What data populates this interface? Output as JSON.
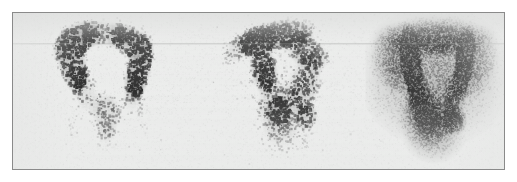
{
  "figure": {
    "kind": "nuclear-medicine-scintigraphy",
    "modality": "bone-scintigraphy",
    "panel_count": 3,
    "caption": "",
    "title": "",
    "labels_present": false,
    "annotations": [],
    "text_elements": []
  },
  "frame": {
    "border_color": "#8a8a8a",
    "border_width_px": 1,
    "plate_background": "#ebeceb",
    "page_background": "#ffffff",
    "x": 12,
    "y": 12,
    "width": 493,
    "height": 158
  },
  "palette": {
    "max_uptake": "#121212",
    "high_uptake": "#2b2b2b",
    "mid_uptake": "#6e6e6e",
    "low_uptake": "#b8b9b8",
    "background_soft_tissue": "#e6e7e6",
    "plate": "#ebeceb",
    "border": "#8a8a8a"
  },
  "artifacts": [
    {
      "name": "horizontal-scan-line",
      "y": 30,
      "opacity": 0.3
    },
    {
      "name": "horizontal-scan-line-faint",
      "y": 31,
      "opacity": 0.14
    }
  ],
  "chart_data": {
    "type": "heatmap",
    "title": "",
    "xlabel": "",
    "ylabel": "",
    "intensity_scale": {
      "min": 0,
      "max": 1,
      "min_label": "low counts",
      "max_label": "high counts",
      "colormap": "inverted-grayscale"
    },
    "panels": [
      {
        "index": 0,
        "name": "panel-left",
        "view": "anterior",
        "x": 18,
        "y": 0,
        "width": 150,
        "height": 156,
        "grain": "coarse",
        "dot_count": 5200,
        "dot_size_px": [
          1,
          3
        ],
        "count_density": "low",
        "noise_seed": 1207,
        "blobs": [
          {
            "name": "left-iliac-crest-arc",
            "cx": 0.3,
            "cy": 0.17,
            "rx": 0.16,
            "ry": 0.085,
            "rot": -32,
            "intensity": 0.98,
            "softness": 0.3
          },
          {
            "name": "left-iliac-wing-band",
            "cx": 0.265,
            "cy": 0.3,
            "rx": 0.085,
            "ry": 0.185,
            "rot": -12,
            "intensity": 0.97,
            "softness": 0.32
          },
          {
            "name": "sacroiliac-arch-superior",
            "cx": 0.47,
            "cy": 0.125,
            "rx": 0.22,
            "ry": 0.075,
            "rot": 0,
            "intensity": 0.62,
            "softness": 0.52
          },
          {
            "name": "right-iliac-crest-arc",
            "cx": 0.655,
            "cy": 0.185,
            "rx": 0.145,
            "ry": 0.08,
            "rot": 30,
            "intensity": 0.86,
            "softness": 0.36
          },
          {
            "name": "right-iliac-wing-band",
            "cx": 0.715,
            "cy": 0.335,
            "rx": 0.075,
            "ry": 0.19,
            "rot": 12,
            "intensity": 0.95,
            "softness": 0.32
          },
          {
            "name": "left-acetabular-region",
            "cx": 0.355,
            "cy": 0.5,
            "rx": 0.075,
            "ry": 0.135,
            "rot": -8,
            "intensity": 0.46,
            "softness": 0.58
          },
          {
            "name": "right-acetabular-region",
            "cx": 0.675,
            "cy": 0.505,
            "rx": 0.07,
            "ry": 0.13,
            "rot": 8,
            "intensity": 0.44,
            "softness": 0.58
          },
          {
            "name": "bladder-midline-activity",
            "cx": 0.5,
            "cy": 0.645,
            "rx": 0.085,
            "ry": 0.13,
            "rot": 0,
            "intensity": 0.58,
            "softness": 0.5
          },
          {
            "name": "pubic-symphysis-faint",
            "cx": 0.495,
            "cy": 0.8,
            "rx": 0.065,
            "ry": 0.065,
            "rot": 0,
            "intensity": 0.26,
            "softness": 0.66
          },
          {
            "name": "left-femur-shaft-trace",
            "cx": 0.275,
            "cy": 0.76,
            "rx": 0.035,
            "ry": 0.155,
            "rot": -5,
            "intensity": 0.16,
            "softness": 0.7
          },
          {
            "name": "right-femur-shaft-trace",
            "cx": 0.735,
            "cy": 0.71,
            "rx": 0.035,
            "ry": 0.13,
            "rot": 5,
            "intensity": 0.14,
            "softness": 0.72
          }
        ]
      },
      {
        "index": 1,
        "name": "panel-middle",
        "view": "oblique",
        "x": 196,
        "y": 0,
        "width": 150,
        "height": 156,
        "grain": "coarse",
        "dot_count": 6400,
        "dot_size_px": [
          1,
          3
        ],
        "count_density": "medium",
        "noise_seed": 4471,
        "focal_lesion": {
          "name": "focal-hot-spot",
          "cx": 0.455,
          "cy": 0.625,
          "intensity": 1.0,
          "note": "intense focal uptake"
        },
        "blobs": [
          {
            "name": "iliac-crest-superior-arc",
            "cx": 0.44,
            "cy": 0.135,
            "rx": 0.235,
            "ry": 0.085,
            "rot": -8,
            "intensity": 0.88,
            "softness": 0.38
          },
          {
            "name": "iliac-wing-upper-dense",
            "cx": 0.315,
            "cy": 0.175,
            "rx": 0.105,
            "ry": 0.075,
            "rot": -26,
            "intensity": 0.96,
            "softness": 0.3
          },
          {
            "name": "iliac-ala-lateral-taper",
            "cx": 0.185,
            "cy": 0.23,
            "rx": 0.105,
            "ry": 0.065,
            "rot": -30,
            "intensity": 0.5,
            "softness": 0.55
          },
          {
            "name": "posterior-ilium-band",
            "cx": 0.655,
            "cy": 0.245,
            "rx": 0.135,
            "ry": 0.085,
            "rot": 28,
            "intensity": 0.7,
            "softness": 0.46
          },
          {
            "name": "sacroiliac-joint-band",
            "cx": 0.355,
            "cy": 0.345,
            "rx": 0.075,
            "ry": 0.145,
            "rot": -10,
            "intensity": 0.84,
            "softness": 0.38
          },
          {
            "name": "greater-sciatic-margin",
            "cx": 0.635,
            "cy": 0.455,
            "rx": 0.085,
            "ry": 0.155,
            "rot": 16,
            "intensity": 0.56,
            "softness": 0.52
          },
          {
            "name": "focal-hot-spot-core",
            "cx": 0.455,
            "cy": 0.625,
            "rx": 0.075,
            "ry": 0.085,
            "rot": 0,
            "intensity": 1.0,
            "softness": 0.16
          },
          {
            "name": "focal-hot-spot-halo",
            "cx": 0.455,
            "cy": 0.625,
            "rx": 0.125,
            "ry": 0.145,
            "rot": 0,
            "intensity": 0.52,
            "softness": 0.55
          },
          {
            "name": "ischial-secondary-focus",
            "cx": 0.645,
            "cy": 0.655,
            "rx": 0.065,
            "ry": 0.075,
            "rot": 0,
            "intensity": 0.76,
            "softness": 0.4
          },
          {
            "name": "inferior-pelvic-scatter",
            "cx": 0.5,
            "cy": 0.8,
            "rx": 0.145,
            "ry": 0.095,
            "rot": 0,
            "intensity": 0.34,
            "softness": 0.64
          },
          {
            "name": "central-pelvic-fill",
            "cx": 0.48,
            "cy": 0.44,
            "rx": 0.205,
            "ry": 0.185,
            "rot": 0,
            "intensity": 0.24,
            "softness": 0.72
          }
        ]
      },
      {
        "index": 2,
        "name": "panel-right",
        "view": "anterior-high-count",
        "x": 352,
        "y": 0,
        "width": 140,
        "height": 156,
        "grain": "fine",
        "dot_count": 17000,
        "dot_size_px": [
          1,
          2
        ],
        "count_density": "high",
        "noise_seed": 8893,
        "blobs": [
          {
            "name": "pelvic-brim-outline",
            "cx": 0.5,
            "cy": 0.4,
            "rx": 0.355,
            "ry": 0.295,
            "rot": 0,
            "intensity": 0.4,
            "softness": 0.7
          },
          {
            "name": "iliac-crest-arc-superior",
            "cx": 0.5,
            "cy": 0.155,
            "rx": 0.3,
            "ry": 0.095,
            "rot": 0,
            "intensity": 0.66,
            "softness": 0.48
          },
          {
            "name": "left-sacroiliac-dense-band",
            "cx": 0.325,
            "cy": 0.305,
            "rx": 0.065,
            "ry": 0.205,
            "rot": -7,
            "intensity": 0.98,
            "softness": 0.26
          },
          {
            "name": "right-iliac-band",
            "cx": 0.705,
            "cy": 0.305,
            "rx": 0.06,
            "ry": 0.185,
            "rot": 8,
            "intensity": 0.72,
            "softness": 0.42
          },
          {
            "name": "left-iliac-ala-wash",
            "cx": 0.215,
            "cy": 0.285,
            "rx": 0.115,
            "ry": 0.155,
            "rot": -16,
            "intensity": 0.42,
            "softness": 0.66
          },
          {
            "name": "right-iliac-ala-wash",
            "cx": 0.79,
            "cy": 0.315,
            "rx": 0.1,
            "ry": 0.155,
            "rot": 16,
            "intensity": 0.38,
            "softness": 0.68
          },
          {
            "name": "bladder-dense-focus",
            "cx": 0.445,
            "cy": 0.665,
            "rx": 0.085,
            "ry": 0.085,
            "rot": 0,
            "intensity": 1.0,
            "softness": 0.22
          },
          {
            "name": "bladder-halo",
            "cx": 0.445,
            "cy": 0.665,
            "rx": 0.145,
            "ry": 0.135,
            "rot": 0,
            "intensity": 0.56,
            "softness": 0.58
          },
          {
            "name": "right-ischiopubic-focus",
            "cx": 0.625,
            "cy": 0.685,
            "rx": 0.075,
            "ry": 0.075,
            "rot": 10,
            "intensity": 0.74,
            "softness": 0.4
          },
          {
            "name": "left-acetabular-column",
            "cx": 0.375,
            "cy": 0.515,
            "rx": 0.065,
            "ry": 0.125,
            "rot": -6,
            "intensity": 0.62,
            "softness": 0.5
          },
          {
            "name": "right-acetabular-column",
            "cx": 0.635,
            "cy": 0.515,
            "rx": 0.06,
            "ry": 0.125,
            "rot": 6,
            "intensity": 0.5,
            "softness": 0.54
          },
          {
            "name": "inferior-pelvic-outflow",
            "cx": 0.49,
            "cy": 0.815,
            "rx": 0.135,
            "ry": 0.095,
            "rot": 0,
            "intensity": 0.36,
            "softness": 0.66
          },
          {
            "name": "central-iliac-lucency",
            "cx": 0.515,
            "cy": 0.365,
            "rx": 0.175,
            "ry": 0.165,
            "rot": 0,
            "intensity": 0.1,
            "softness": 0.85
          }
        ]
      }
    ]
  }
}
